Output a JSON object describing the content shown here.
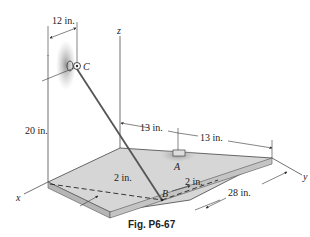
{
  "figure": {
    "caption": "Fig. P6-67",
    "axes": {
      "x": "x",
      "y": "y",
      "z": "z"
    },
    "points": {
      "A": "A",
      "B": "B",
      "C": "C"
    },
    "dimensions": {
      "horizontal_C": "12 in.",
      "height_C": "20 in.",
      "z_to_A": "13 in.",
      "A_to_edge": "13 in.",
      "plate_depth": "28 in.",
      "B_offset_x": "2 in.",
      "B_offset_y": "2 in."
    },
    "colors": {
      "plate_top": "#d4d4d4",
      "plate_edge": "#b8b8b8",
      "wall_shade": "#9a9a9a",
      "line": "#333333"
    }
  }
}
